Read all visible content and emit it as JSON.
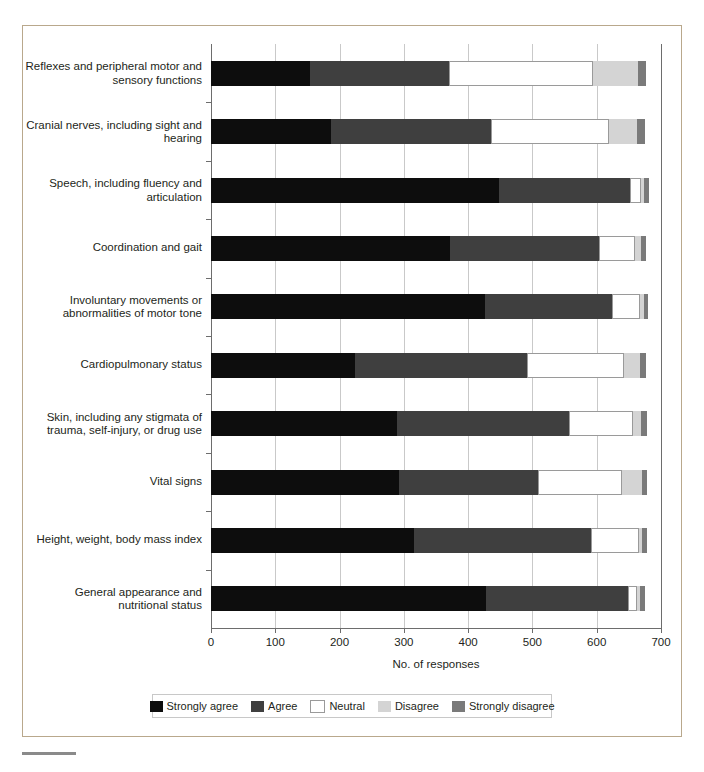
{
  "chart_data": {
    "type": "bar",
    "orientation": "horizontal",
    "stacked": true,
    "title": "",
    "xlabel": "No. of responses",
    "ylabel": "",
    "xlim": [
      0,
      700
    ],
    "xticks": [
      0,
      100,
      200,
      300,
      400,
      500,
      600,
      700
    ],
    "grid": true,
    "legend_position": "bottom",
    "categories": [
      "Reflexes and peripheral motor and sensory functions",
      "Cranial nerves, including sight and hearing",
      "Speech, including fluency and articulation",
      "Coordination and gait",
      "Involuntary movements or abnormalities of motor tone",
      "Cardiopulmonary status",
      "Skin, including any stigmata of trauma, self-injury, or drug use",
      "Vital signs",
      "Height, weight, body mass index",
      "General appearance and nutritional status"
    ],
    "series": [
      {
        "name": "Strongly agree",
        "color": "#0d0d0d",
        "values": [
          154,
          187,
          448,
          371,
          426,
          224,
          289,
          292,
          316,
          428
        ]
      },
      {
        "name": "Agree",
        "color": "#3f3f3f",
        "values": [
          216,
          248,
          204,
          233,
          198,
          267,
          268,
          216,
          275,
          220
        ]
      },
      {
        "name": "Neutral",
        "color": "#ffffff",
        "values": [
          224,
          184,
          17,
          56,
          44,
          151,
          100,
          132,
          75,
          15
        ]
      },
      {
        "name": "Disagree",
        "color": "#d4d4d4",
        "values": [
          70,
          44,
          5,
          9,
          5,
          26,
          12,
          30,
          5,
          5
        ]
      },
      {
        "name": "Strongly disagree",
        "color": "#7a7a7a",
        "values": [
          13,
          12,
          7,
          8,
          7,
          9,
          9,
          8,
          7,
          7
        ]
      }
    ]
  },
  "legend": {
    "items": [
      {
        "label": "Strongly agree",
        "color": "#0d0d0d"
      },
      {
        "label": "Agree",
        "color": "#3f3f3f"
      },
      {
        "label": "Neutral",
        "color": "#ffffff"
      },
      {
        "label": "Disagree",
        "color": "#d4d4d4"
      },
      {
        "label": "Strongly disagree",
        "color": "#7a7a7a"
      }
    ]
  }
}
